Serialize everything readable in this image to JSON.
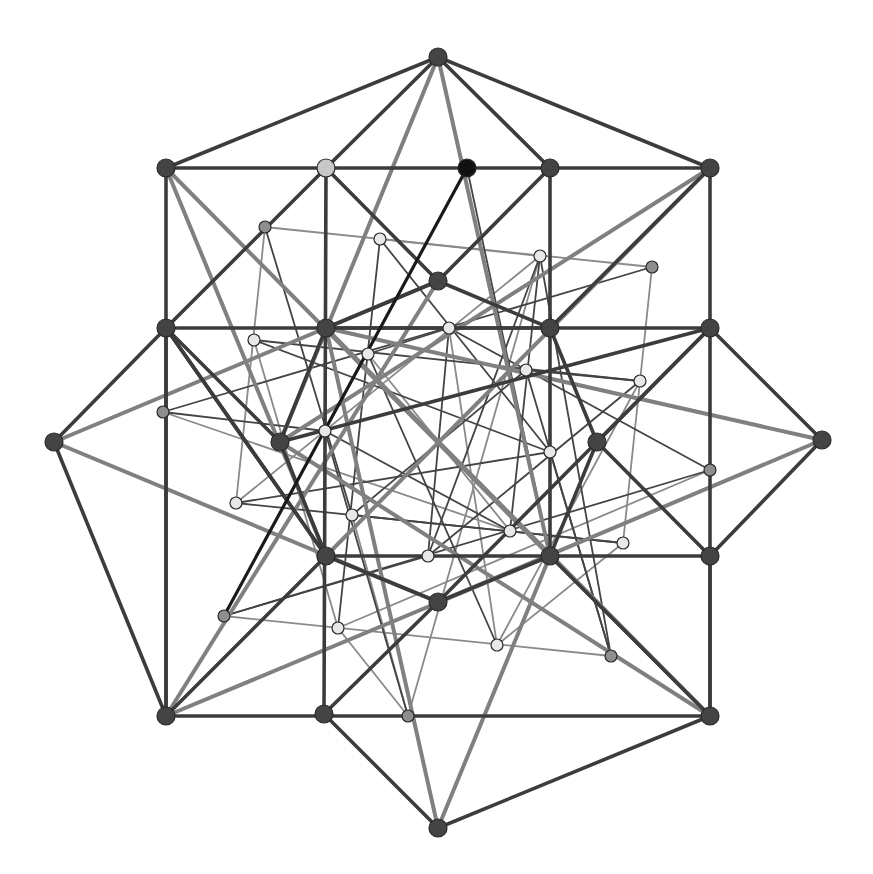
{
  "diagram": {
    "title": "",
    "colors": {
      "background": "#ffffff",
      "dark_edge": "#3c3c3c",
      "gray_edge": "#808080",
      "thin_dark_edge": "#444444",
      "thin_gray_edge": "#8a8a8a",
      "highlight_edge": "#1a1a1a",
      "dark_node": "#444444",
      "black_node": "#111111",
      "gray_node": "#8e8e8e",
      "light_node": "#e8e8e8",
      "highlight_light_node": "#c8c8c8"
    },
    "nodes": [
      {
        "id": "tip-top",
        "x": 438,
        "y": 57,
        "r": 9,
        "kind": "dark"
      },
      {
        "id": "tip-bottom",
        "x": 438,
        "y": 828,
        "r": 9,
        "kind": "dark"
      },
      {
        "id": "tip-left",
        "x": 54,
        "y": 442,
        "r": 9,
        "kind": "dark"
      },
      {
        "id": "tip-right",
        "x": 822,
        "y": 440,
        "r": 9,
        "kind": "dark"
      },
      {
        "id": "corner-tl",
        "x": 166,
        "y": 168,
        "r": 9,
        "kind": "dark"
      },
      {
        "id": "corner-tr",
        "x": 710,
        "y": 168,
        "r": 9,
        "kind": "dark"
      },
      {
        "id": "corner-bl",
        "x": 166,
        "y": 716,
        "r": 9,
        "kind": "dark"
      },
      {
        "id": "corner-br",
        "x": 710,
        "y": 716,
        "r": 9,
        "kind": "dark"
      },
      {
        "id": "top-a",
        "x": 326,
        "y": 168,
        "r": 9,
        "kind": "highlight_light"
      },
      {
        "id": "top-b",
        "x": 467,
        "y": 168,
        "r": 9,
        "kind": "black"
      },
      {
        "id": "top-c",
        "x": 550,
        "y": 168,
        "r": 9,
        "kind": "dark"
      },
      {
        "id": "g-l1",
        "x": 166,
        "y": 328,
        "r": 9,
        "kind": "dark"
      },
      {
        "id": "g-l2",
        "x": 326,
        "y": 328,
        "r": 9,
        "kind": "dark"
      },
      {
        "id": "g-r2",
        "x": 550,
        "y": 328,
        "r": 9,
        "kind": "dark"
      },
      {
        "id": "g-r1",
        "x": 710,
        "y": 328,
        "r": 9,
        "kind": "dark"
      },
      {
        "id": "g-bl2",
        "x": 326,
        "y": 556,
        "r": 9,
        "kind": "dark"
      },
      {
        "id": "g-br2",
        "x": 550,
        "y": 556,
        "r": 9,
        "kind": "dark"
      },
      {
        "id": "g-br1",
        "x": 710,
        "y": 556,
        "r": 9,
        "kind": "dark"
      },
      {
        "id": "bot-a",
        "x": 324,
        "y": 714,
        "r": 9,
        "kind": "dark"
      },
      {
        "id": "bot-b",
        "x": 408,
        "y": 716,
        "r": 6,
        "kind": "gray"
      },
      {
        "id": "mid-top",
        "x": 438,
        "y": 281,
        "r": 9,
        "kind": "dark"
      },
      {
        "id": "mid-left",
        "x": 280,
        "y": 442,
        "r": 9,
        "kind": "dark"
      },
      {
        "id": "mid-right",
        "x": 597,
        "y": 442,
        "r": 9,
        "kind": "dark"
      },
      {
        "id": "mid-bottom",
        "x": 438,
        "y": 602,
        "r": 9,
        "kind": "dark"
      },
      {
        "id": "s1",
        "x": 265,
        "y": 227,
        "r": 6,
        "kind": "gray"
      },
      {
        "id": "s2",
        "x": 652,
        "y": 267,
        "r": 6,
        "kind": "gray"
      },
      {
        "id": "s3",
        "x": 163,
        "y": 412,
        "r": 6,
        "kind": "gray"
      },
      {
        "id": "s4",
        "x": 710,
        "y": 470,
        "r": 6,
        "kind": "gray"
      },
      {
        "id": "s5",
        "x": 224,
        "y": 616,
        "r": 6,
        "kind": "gray"
      },
      {
        "id": "s6",
        "x": 611,
        "y": 656,
        "r": 6,
        "kind": "gray"
      },
      {
        "id": "w1",
        "x": 380,
        "y": 239,
        "r": 6,
        "kind": "light"
      },
      {
        "id": "w2",
        "x": 540,
        "y": 256,
        "r": 6,
        "kind": "light"
      },
      {
        "id": "w3",
        "x": 254,
        "y": 340,
        "r": 6,
        "kind": "light"
      },
      {
        "id": "w4",
        "x": 449,
        "y": 328,
        "r": 6,
        "kind": "light"
      },
      {
        "id": "w5",
        "x": 368,
        "y": 354,
        "r": 6,
        "kind": "light"
      },
      {
        "id": "w6",
        "x": 526,
        "y": 370,
        "r": 6,
        "kind": "light"
      },
      {
        "id": "w7",
        "x": 640,
        "y": 381,
        "r": 6,
        "kind": "light"
      },
      {
        "id": "w8",
        "x": 325,
        "y": 431,
        "r": 6,
        "kind": "light"
      },
      {
        "id": "w9",
        "x": 550,
        "y": 452,
        "r": 6,
        "kind": "light"
      },
      {
        "id": "w10",
        "x": 236,
        "y": 503,
        "r": 6,
        "kind": "light"
      },
      {
        "id": "w11",
        "x": 352,
        "y": 515,
        "r": 6,
        "kind": "light"
      },
      {
        "id": "w12",
        "x": 510,
        "y": 531,
        "r": 6,
        "kind": "light"
      },
      {
        "id": "w13",
        "x": 623,
        "y": 543,
        "r": 6,
        "kind": "light"
      },
      {
        "id": "w14",
        "x": 428,
        "y": 556,
        "r": 6,
        "kind": "light"
      },
      {
        "id": "w15",
        "x": 338,
        "y": 628,
        "r": 6,
        "kind": "light"
      },
      {
        "id": "w16",
        "x": 497,
        "y": 645,
        "r": 6,
        "kind": "light"
      }
    ],
    "edges": [
      [
        "tip-top",
        "corner-tl",
        "dark"
      ],
      [
        "tip-top",
        "corner-tr",
        "dark"
      ],
      [
        "tip-top",
        "top-a",
        "dark"
      ],
      [
        "tip-top",
        "top-c",
        "dark"
      ],
      [
        "corner-tl",
        "corner-tr",
        "dark"
      ],
      [
        "corner-bl",
        "corner-br",
        "dark"
      ],
      [
        "corner-tl",
        "corner-bl",
        "dark"
      ],
      [
        "corner-tr",
        "corner-br",
        "dark"
      ],
      [
        "g-l1",
        "g-r1",
        "dark"
      ],
      [
        "g-bl2",
        "g-br1",
        "dark"
      ],
      [
        "corner-bl",
        "g-bl2",
        "dark"
      ],
      [
        "top-a",
        "bot-a",
        "dark"
      ],
      [
        "top-c",
        "g-br2",
        "dark"
      ],
      [
        "g-br2",
        "corner-br",
        "dark"
      ],
      [
        "tip-left",
        "g-l1",
        "dark"
      ],
      [
        "tip-left",
        "corner-bl",
        "dark"
      ],
      [
        "tip-right",
        "g-r1",
        "dark"
      ],
      [
        "tip-right",
        "g-br1",
        "dark"
      ],
      [
        "tip-bottom",
        "bot-a",
        "dark"
      ],
      [
        "tip-bottom",
        "corner-br",
        "dark"
      ],
      [
        "top-a",
        "g-l1",
        "dark"
      ],
      [
        "top-c",
        "mid-top",
        "dark"
      ],
      [
        "top-a",
        "mid-top",
        "dark"
      ],
      [
        "g-l1",
        "mid-left",
        "dark"
      ],
      [
        "mid-left",
        "g-l2",
        "dark"
      ],
      [
        "mid-top",
        "g-r2",
        "dark"
      ],
      [
        "g-r2",
        "mid-right",
        "dark"
      ],
      [
        "mid-right",
        "g-r1",
        "dark"
      ],
      [
        "mid-right",
        "g-br2",
        "dark"
      ],
      [
        "mid-left",
        "g-bl2",
        "dark"
      ],
      [
        "g-bl2",
        "mid-bottom",
        "dark"
      ],
      [
        "mid-bottom",
        "g-br2",
        "dark"
      ],
      [
        "g-l1",
        "g-bl2",
        "dark"
      ],
      [
        "corner-tr",
        "g-r2",
        "dark"
      ],
      [
        "mid-top",
        "g-l2",
        "dark"
      ],
      [
        "mid-bottom",
        "bot-a",
        "dark"
      ],
      [
        "corner-bl",
        "g-l1",
        "dark"
      ],
      [
        "mid-right",
        "g-br1",
        "dark"
      ],
      [
        "g-r1",
        "mid-bottom",
        "dark"
      ],
      [
        "g-l1",
        "g-bl2",
        "dark"
      ],
      [
        "g-br1",
        "corner-br",
        "dark"
      ],
      [
        "g-l2",
        "g-r2",
        "dark"
      ],
      [
        "mid-left",
        "g-r1",
        "dark"
      ],
      [
        "tip-top",
        "mid-left",
        "gray"
      ],
      [
        "tip-top",
        "g-br2",
        "gray"
      ],
      [
        "tip-bottom",
        "g-l2",
        "gray"
      ],
      [
        "tip-bottom",
        "g-br2",
        "gray"
      ],
      [
        "tip-left",
        "mid-top",
        "gray"
      ],
      [
        "tip-left",
        "mid-bottom",
        "gray"
      ],
      [
        "tip-right",
        "g-l2",
        "gray"
      ],
      [
        "tip-right",
        "mid-bottom",
        "gray"
      ],
      [
        "corner-tl",
        "g-bl2",
        "gray"
      ],
      [
        "corner-tl",
        "g-br2",
        "gray"
      ],
      [
        "corner-tr",
        "mid-left",
        "gray"
      ],
      [
        "corner-tr",
        "g-bl2",
        "gray"
      ],
      [
        "corner-bl",
        "mid-top",
        "gray"
      ],
      [
        "corner-bl",
        "g-br2",
        "gray"
      ],
      [
        "corner-br",
        "g-l2",
        "gray"
      ],
      [
        "corner-br",
        "mid-left",
        "gray"
      ],
      [
        "top-b",
        "s5",
        "highlight"
      ],
      [
        "top-b",
        "w8",
        "thin_gray"
      ],
      [
        "top-b",
        "g-br2",
        "thin_dark"
      ],
      [
        "s1",
        "w10",
        "thin_gray"
      ],
      [
        "s1",
        "s2",
        "thin_gray"
      ],
      [
        "s1",
        "w11",
        "thin_dark"
      ],
      [
        "w1",
        "w2",
        "thin_gray"
      ],
      [
        "w1",
        "w15",
        "thin_dark"
      ],
      [
        "w1",
        "w9",
        "thin_dark"
      ],
      [
        "w2",
        "w12",
        "thin_dark"
      ],
      [
        "w2",
        "w10",
        "thin_gray"
      ],
      [
        "w2",
        "s6",
        "thin_dark"
      ],
      [
        "s2",
        "s3",
        "thin_dark"
      ],
      [
        "s2",
        "w13",
        "thin_gray"
      ],
      [
        "w3",
        "w7",
        "thin_dark"
      ],
      [
        "w3",
        "w15",
        "thin_gray"
      ],
      [
        "w3",
        "w9",
        "thin_dark"
      ],
      [
        "w4",
        "s4",
        "thin_dark"
      ],
      [
        "w4",
        "w14",
        "thin_dark"
      ],
      [
        "w4",
        "w5",
        "thin_dark"
      ],
      [
        "w5",
        "w16",
        "thin_dark"
      ],
      [
        "w5",
        "w12",
        "thin_gray"
      ],
      [
        "w6",
        "w7",
        "thin_dark"
      ],
      [
        "w6",
        "w11",
        "thin_dark"
      ],
      [
        "w6",
        "s6",
        "thin_dark"
      ],
      [
        "s3",
        "w12",
        "thin_gray"
      ],
      [
        "s3",
        "w8",
        "thin_dark"
      ],
      [
        "w7",
        "w16",
        "thin_gray"
      ],
      [
        "w7",
        "w14",
        "thin_dark"
      ],
      [
        "w8",
        "w12",
        "thin_dark"
      ],
      [
        "w8",
        "bot-b",
        "thin_dark"
      ],
      [
        "w9",
        "w10",
        "thin_dark"
      ],
      [
        "w9",
        "s6",
        "thin_dark"
      ],
      [
        "w10",
        "w13",
        "thin_dark"
      ],
      [
        "s4",
        "s5",
        "thin_dark"
      ],
      [
        "s4",
        "w15",
        "thin_gray"
      ],
      [
        "w11",
        "w13",
        "thin_dark"
      ],
      [
        "w11",
        "bot-b",
        "thin_gray"
      ],
      [
        "w13",
        "w16",
        "thin_gray"
      ],
      [
        "w14",
        "s5",
        "thin_dark"
      ],
      [
        "w14",
        "w2",
        "thin_dark"
      ],
      [
        "s5",
        "s6",
        "thin_gray"
      ],
      [
        "w15",
        "bot-b",
        "thin_gray"
      ],
      [
        "w16",
        "w4",
        "thin_gray"
      ],
      [
        "bot-b",
        "w2",
        "thin_gray"
      ]
    ]
  }
}
